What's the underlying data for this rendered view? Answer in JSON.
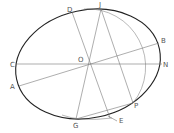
{
  "diagram": {
    "type": "ellipse-construction",
    "colors": {
      "ellipse": "#222222",
      "construction": "#777777",
      "labels": "#555555",
      "background": "#ffffff"
    },
    "points": {
      "O": {
        "label": "O"
      },
      "C": {
        "label": "C"
      },
      "N": {
        "label": "N"
      },
      "A": {
        "label": "A"
      },
      "B": {
        "label": "B"
      },
      "D": {
        "label": "D"
      },
      "E": {
        "label": "E"
      },
      "J": {
        "label": "J"
      },
      "G": {
        "label": "G"
      },
      "P": {
        "label": "P"
      }
    },
    "lines": [
      "C-N",
      "A-B",
      "D-E",
      "J-G",
      "J-P",
      "G-P"
    ],
    "arcs": [
      "circle arc through J and P",
      "arc near G"
    ]
  }
}
